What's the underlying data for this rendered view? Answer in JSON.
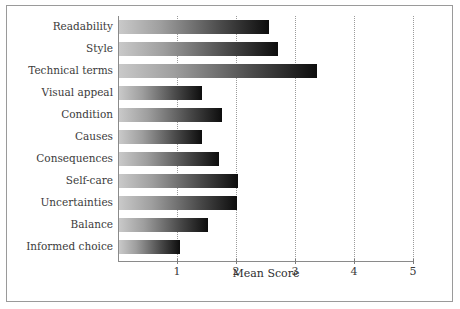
{
  "chart_data": {
    "type": "bar",
    "orientation": "horizontal",
    "title": "",
    "xlabel": "Mean Score",
    "ylabel": "",
    "xlim": [
      0,
      5
    ],
    "xticks": [
      "1",
      "2",
      "3",
      "4",
      "5"
    ],
    "xtick_values": [
      1,
      2,
      3,
      4,
      5
    ],
    "grid": "vertical-dotted",
    "legend": "none",
    "categories": [
      "Readability",
      "Style",
      "Technical terms",
      "Visual appeal",
      "Condition",
      "Causes",
      "Consequences",
      "Self-care",
      "Uncertainties",
      "Balance",
      "Informed choice"
    ],
    "values": [
      2.55,
      2.7,
      3.35,
      1.4,
      1.75,
      1.4,
      1.7,
      2.02,
      2.0,
      1.5,
      1.03
    ],
    "bar_style": {
      "gradient_from": "#c9c9c9",
      "gradient_to": "#0d0d0d",
      "direction": "left-to-right"
    }
  },
  "colors": {
    "frame": "#9a9a9a",
    "axis": "#8a8a8a",
    "gridline": "#9b9b9b",
    "text": "#3b3b3b",
    "background": "#ffffff"
  }
}
